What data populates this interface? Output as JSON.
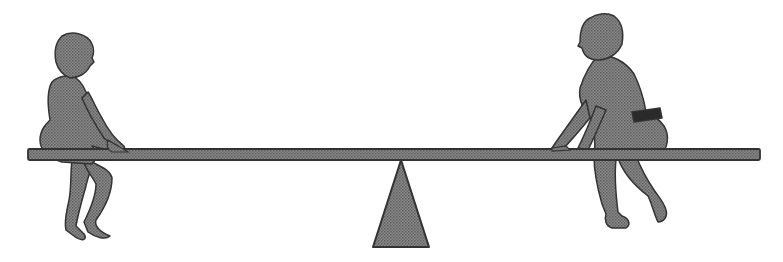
{
  "scene": {
    "description": "Two children sitting on opposite ends of a balanced seesaw plank resting on a triangular fulcrum",
    "fill_color": "#7a7a7a",
    "outline_color": "#3a3a3a",
    "background_color": "#ffffff",
    "elements": {
      "plank": "seesaw-plank",
      "fulcrum": "triangular-fulcrum",
      "left_child": "child-left-seated",
      "right_child": "child-right-seated"
    }
  }
}
